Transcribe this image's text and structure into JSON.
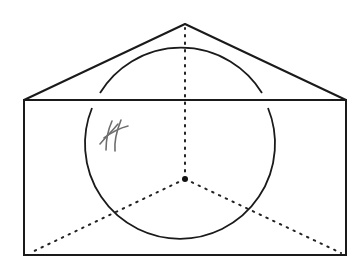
{
  "diagram": {
    "colors": {
      "stroke": "#1a1a1a",
      "dotted": "#222222",
      "pencil": "#6e6e6e",
      "background": "#ffffff"
    },
    "rectangle": {
      "x1": 24,
      "y1": 100,
      "x2": 346,
      "y2": 255
    },
    "apex": {
      "x": 185,
      "y": 24
    },
    "circle": {
      "cx": 181,
      "cy": 144,
      "r": 95
    },
    "center_point": {
      "x": 185,
      "y": 179
    },
    "dotted_segments": [
      {
        "to": "apex",
        "x": 185,
        "y": 26
      },
      {
        "to": "bottom-left",
        "x": 30,
        "y": 253
      },
      {
        "to": "bottom-right",
        "x": 341,
        "y": 253
      }
    ],
    "annotation": {
      "type": "hand-drawn hash mark",
      "x": 112,
      "y": 135
    }
  }
}
